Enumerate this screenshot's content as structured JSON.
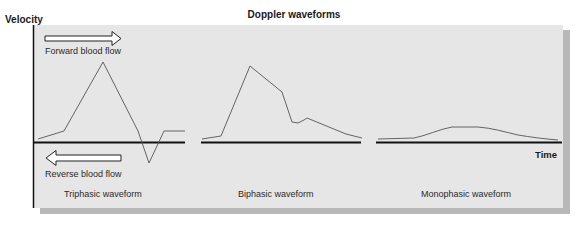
{
  "title": "Doppler waveforms",
  "axes": {
    "y_label": "Velocity",
    "x_label": "Time"
  },
  "arrows": {
    "forward": {
      "label": "Forward blood flow",
      "direction": "right"
    },
    "reverse": {
      "label": "Reverse blood flow",
      "direction": "left"
    }
  },
  "waveforms": [
    {
      "name": "Triphasic waveform"
    },
    {
      "name": "Biphasic waveform"
    },
    {
      "name": "Monophasic waveform"
    }
  ],
  "colors": {
    "panel": "#e6e6e6",
    "shadow": "#b8b8b8",
    "trace": "#555555",
    "baseline": "#111111"
  }
}
